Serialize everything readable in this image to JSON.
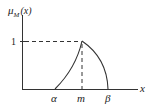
{
  "diagram": {
    "type": "fuzzy-membership-function",
    "y_axis_label": "μ",
    "y_axis_subscript": "M",
    "y_axis_arg": "(x)",
    "x_axis_label": "x",
    "y_tick_label": "1",
    "x_ticks": [
      {
        "label": "α",
        "role": "left support"
      },
      {
        "label": "m",
        "role": "peak"
      },
      {
        "label": "β",
        "role": "right support"
      }
    ],
    "curves": {
      "left": "concave rise from α to peak at (m, 1)",
      "right": "convex fall from peak at (m, 1) to β"
    },
    "colors": {
      "stroke": "#333333",
      "background": "#ffffff"
    }
  }
}
